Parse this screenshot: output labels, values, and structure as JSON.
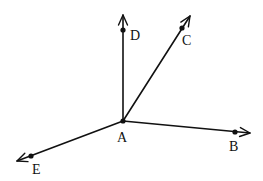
{
  "diagram": {
    "type": "rays-from-common-vertex",
    "vertex": {
      "label": "A",
      "x": 123,
      "y": 121,
      "label_x": 117,
      "label_y": 142
    },
    "rays": [
      {
        "name": "ray-AD",
        "label": "D",
        "end_x": 123,
        "end_y": 15,
        "point_x": 123,
        "point_y": 30,
        "label_x": 130,
        "label_y": 40
      },
      {
        "name": "ray-AC",
        "label": "C",
        "end_x": 190,
        "end_y": 16,
        "point_x": 182,
        "point_y": 28,
        "label_x": 182,
        "label_y": 45
      },
      {
        "name": "ray-AB",
        "label": "B",
        "end_x": 250,
        "end_y": 133,
        "point_x": 235,
        "point_y": 132,
        "label_x": 229,
        "label_y": 151
      },
      {
        "name": "ray-AE",
        "label": "E",
        "end_x": 17,
        "end_y": 161,
        "point_x": 31,
        "point_y": 156,
        "label_x": 32,
        "label_y": 174
      }
    ],
    "stroke_color": "#111111",
    "background": "#ffffff"
  }
}
